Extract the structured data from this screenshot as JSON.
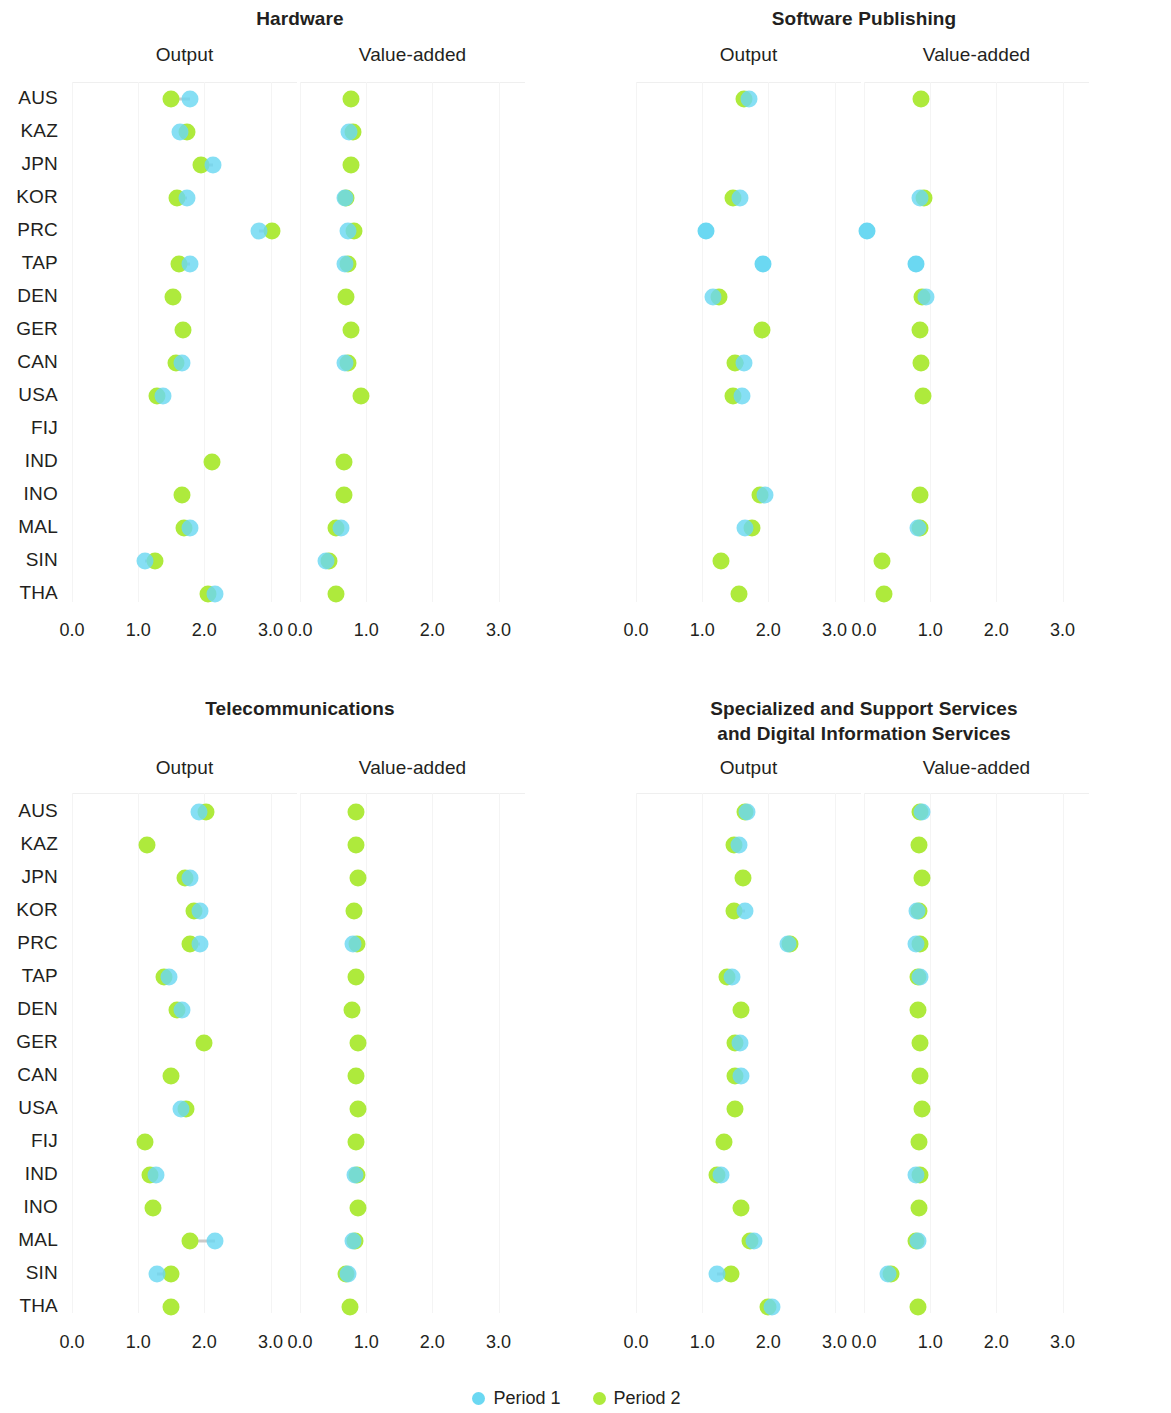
{
  "legend": {
    "items": [
      {
        "label": "Period 1",
        "color": "#6bd8f2",
        "key": "p1"
      },
      {
        "label": "Period 2",
        "color": "#aeea3c",
        "key": "p2"
      }
    ]
  },
  "economies": [
    "AUS",
    "KAZ",
    "JPN",
    "KOR",
    "PRC",
    "TAP",
    "DEN",
    "GER",
    "CAN",
    "USA",
    "FIJ",
    "IND",
    "INO",
    "MAL",
    "SIN",
    "THA"
  ],
  "subpanel_labels": {
    "output": "Output",
    "value_added": "Value-added"
  },
  "axis": {
    "ticks": [
      "0.0",
      "1.0",
      "2.0",
      "3.0"
    ],
    "tick_values": [
      0.0,
      1.0,
      2.0,
      3.0
    ],
    "min": 0.0,
    "max": 3.4
  },
  "panels": [
    {
      "title": "Hardware"
    },
    {
      "title": "Software Publishing"
    },
    {
      "title": "Telecommunications"
    },
    {
      "title": "Specialized and Support Services\nand Digital Information Services"
    }
  ],
  "chart_data": {
    "type": "scatter",
    "title": "",
    "subtitle": "",
    "xlabel": "",
    "ylabel": "",
    "xlim": [
      0.0,
      3.4
    ],
    "grid": true,
    "legend_position": "bottom",
    "series": [
      {
        "name": "Period 1",
        "color": "#6bd8f2"
      },
      {
        "name": "Period 2",
        "color": "#aeea3c"
      }
    ],
    "categories": [
      "AUS",
      "KAZ",
      "JPN",
      "KOR",
      "PRC",
      "TAP",
      "DEN",
      "GER",
      "CAN",
      "USA",
      "FIJ",
      "IND",
      "INO",
      "MAL",
      "SIN",
      "THA"
    ],
    "panels": [
      {
        "title": "Hardware",
        "subpanels": [
          {
            "label": "Output",
            "points": [
              {
                "category": "AUS",
                "period1": 1.79,
                "period2": 1.5
              },
              {
                "category": "KAZ",
                "period1": 1.63,
                "period2": 1.74
              },
              {
                "category": "JPN",
                "period1": 2.13,
                "period2": 1.95
              },
              {
                "category": "KOR",
                "period1": 1.74,
                "period2": 1.58
              },
              {
                "category": "PRC",
                "period1": 2.82,
                "period2": 3.02
              },
              {
                "category": "TAP",
                "period1": 1.78,
                "period2": 1.62
              },
              {
                "category": "DEN",
                "period1": null,
                "period2": 1.53
              },
              {
                "category": "GER",
                "period1": null,
                "period2": 1.68
              },
              {
                "category": "CAN",
                "period1": 1.66,
                "period2": 1.57
              },
              {
                "category": "USA",
                "period1": 1.38,
                "period2": 1.28
              },
              {
                "category": "FIJ",
                "period1": null,
                "period2": null
              },
              {
                "category": "IND",
                "period1": null,
                "period2": 2.11
              },
              {
                "category": "INO",
                "period1": null,
                "period2": 1.66
              },
              {
                "category": "MAL",
                "period1": 1.78,
                "period2": 1.69
              },
              {
                "category": "SIN",
                "period1": 1.1,
                "period2": 1.25
              },
              {
                "category": "THA",
                "period1": 2.16,
                "period2": 2.06
              }
            ]
          },
          {
            "label": "Value-added",
            "points": [
              {
                "category": "AUS",
                "period1": null,
                "period2": 0.77
              },
              {
                "category": "KAZ",
                "period1": 0.74,
                "period2": 0.8
              },
              {
                "category": "JPN",
                "period1": null,
                "period2": 0.77
              },
              {
                "category": "KOR",
                "period1": 0.68,
                "period2": 0.7
              },
              {
                "category": "PRC",
                "period1": 0.72,
                "period2": 0.81
              },
              {
                "category": "TAP",
                "period1": 0.68,
                "period2": 0.72
              },
              {
                "category": "DEN",
                "period1": null,
                "period2": 0.7
              },
              {
                "category": "GER",
                "period1": null,
                "period2": 0.77
              },
              {
                "category": "CAN",
                "period1": 0.68,
                "period2": 0.72
              },
              {
                "category": "USA",
                "period1": null,
                "period2": 0.92
              },
              {
                "category": "FIJ",
                "period1": null,
                "period2": null
              },
              {
                "category": "IND",
                "period1": null,
                "period2": 0.66
              },
              {
                "category": "INO",
                "period1": null,
                "period2": 0.66
              },
              {
                "category": "MAL",
                "period1": 0.62,
                "period2": 0.54
              },
              {
                "category": "SIN",
                "period1": 0.4,
                "period2": 0.44
              },
              {
                "category": "THA",
                "period1": null,
                "period2": 0.54
              }
            ]
          }
        ]
      },
      {
        "title": "Software Publishing",
        "subpanels": [
          {
            "label": "Output",
            "points": [
              {
                "category": "AUS",
                "period1": 1.7,
                "period2": 1.63
              },
              {
                "category": "KAZ",
                "period1": null,
                "period2": null
              },
              {
                "category": "JPN",
                "period1": null,
                "period2": null
              },
              {
                "category": "KOR",
                "period1": 1.57,
                "period2": 1.46
              },
              {
                "category": "PRC",
                "period1": 1.06,
                "period2": null
              },
              {
                "category": "TAP",
                "period1": 1.92,
                "period2": null
              },
              {
                "category": "DEN",
                "period1": 1.17,
                "period2": 1.25
              },
              {
                "category": "GER",
                "period1": null,
                "period2": 1.9
              },
              {
                "category": "CAN",
                "period1": 1.63,
                "period2": 1.49
              },
              {
                "category": "USA",
                "period1": 1.6,
                "period2": 1.47
              },
              {
                "category": "FIJ",
                "period1": null,
                "period2": null
              },
              {
                "category": "IND",
                "period1": null,
                "period2": null
              },
              {
                "category": "INO",
                "period1": 1.95,
                "period2": 1.87
              },
              {
                "category": "MAL",
                "period1": 1.65,
                "period2": 1.76
              },
              {
                "category": "SIN",
                "period1": null,
                "period2": 1.29
              },
              {
                "category": "THA",
                "period1": null,
                "period2": 1.55
              }
            ]
          },
          {
            "label": "Value-added",
            "points": [
              {
                "category": "AUS",
                "period1": null,
                "period2": 0.86
              },
              {
                "category": "KAZ",
                "period1": null,
                "period2": null
              },
              {
                "category": "JPN",
                "period1": null,
                "period2": null
              },
              {
                "category": "KOR",
                "period1": 0.84,
                "period2": 0.91
              },
              {
                "category": "PRC",
                "period1": 0.05,
                "period2": null
              },
              {
                "category": "TAP",
                "period1": 0.79,
                "period2": null
              },
              {
                "category": "DEN",
                "period1": 0.93,
                "period2": 0.88
              },
              {
                "category": "GER",
                "period1": null,
                "period2": 0.84
              },
              {
                "category": "CAN",
                "period1": null,
                "period2": 0.86
              },
              {
                "category": "USA",
                "period1": null,
                "period2": 0.89
              },
              {
                "category": "FIJ",
                "period1": null,
                "period2": null
              },
              {
                "category": "IND",
                "period1": null,
                "period2": null
              },
              {
                "category": "INO",
                "period1": null,
                "period2": 0.85
              },
              {
                "category": "MAL",
                "period1": 0.82,
                "period2": 0.85
              },
              {
                "category": "SIN",
                "period1": null,
                "period2": 0.27
              },
              {
                "category": "THA",
                "period1": null,
                "period2": 0.3
              }
            ]
          }
        ]
      },
      {
        "title": "Telecommunications",
        "subpanels": [
          {
            "label": "Output",
            "points": [
              {
                "category": "AUS",
                "period1": 1.92,
                "period2": 2.03
              },
              {
                "category": "KAZ",
                "period1": null,
                "period2": 1.13
              },
              {
                "category": "JPN",
                "period1": 1.78,
                "period2": 1.71
              },
              {
                "category": "KOR",
                "period1": 1.93,
                "period2": 1.84
              },
              {
                "category": "PRC",
                "period1": 1.93,
                "period2": 1.79
              },
              {
                "category": "TAP",
                "period1": 1.46,
                "period2": 1.39
              },
              {
                "category": "DEN",
                "period1": 1.66,
                "period2": 1.59
              },
              {
                "category": "GER",
                "period1": null,
                "period2": 2.0
              },
              {
                "category": "CAN",
                "period1": null,
                "period2": 1.49
              },
              {
                "category": "USA",
                "period1": 1.64,
                "period2": 1.72
              },
              {
                "category": "FIJ",
                "period1": null,
                "period2": 1.11
              },
              {
                "category": "IND",
                "period1": 1.27,
                "period2": 1.18
              },
              {
                "category": "INO",
                "period1": null,
                "period2": 1.22
              },
              {
                "category": "MAL",
                "period1": 2.16,
                "period2": 1.78
              },
              {
                "category": "SIN",
                "period1": 1.28,
                "period2": 1.49
              },
              {
                "category": "THA",
                "period1": null,
                "period2": 1.5
              }
            ]
          },
          {
            "label": "Value-added",
            "points": [
              {
                "category": "AUS",
                "period1": null,
                "period2": 0.85
              },
              {
                "category": "KAZ",
                "period1": null,
                "period2": 0.85
              },
              {
                "category": "JPN",
                "period1": null,
                "period2": 0.88
              },
              {
                "category": "KOR",
                "period1": null,
                "period2": 0.82
              },
              {
                "category": "PRC",
                "period1": 0.8,
                "period2": 0.86
              },
              {
                "category": "TAP",
                "period1": null,
                "period2": 0.85
              },
              {
                "category": "DEN",
                "period1": null,
                "period2": 0.78
              },
              {
                "category": "GER",
                "period1": null,
                "period2": 0.87
              },
              {
                "category": "CAN",
                "period1": null,
                "period2": 0.85
              },
              {
                "category": "USA",
                "period1": null,
                "period2": 0.88
              },
              {
                "category": "FIJ",
                "period1": null,
                "period2": 0.85
              },
              {
                "category": "IND",
                "period1": 0.83,
                "period2": 0.86
              },
              {
                "category": "INO",
                "period1": null,
                "period2": 0.88
              },
              {
                "category": "MAL",
                "period1": 0.8,
                "period2": 0.83
              },
              {
                "category": "SIN",
                "period1": 0.73,
                "period2": 0.7
              },
              {
                "category": "THA",
                "period1": null,
                "period2": 0.76
              }
            ]
          }
        ]
      },
      {
        "title": "Specialized and Support Services\nand Digital Information Services",
        "subpanels": [
          {
            "label": "Output",
            "points": [
              {
                "category": "AUS",
                "period1": 1.68,
                "period2": 1.64
              },
              {
                "category": "KAZ",
                "period1": 1.56,
                "period2": 1.48
              },
              {
                "category": "JPN",
                "period1": null,
                "period2": 1.62
              },
              {
                "category": "KOR",
                "period1": 1.65,
                "period2": 1.48
              },
              {
                "category": "PRC",
                "period1": 2.3,
                "period2": 2.33
              },
              {
                "category": "TAP",
                "period1": 1.45,
                "period2": 1.37
              },
              {
                "category": "DEN",
                "period1": null,
                "period2": 1.58
              },
              {
                "category": "GER",
                "period1": 1.57,
                "period2": 1.5
              },
              {
                "category": "CAN",
                "period1": 1.59,
                "period2": 1.5
              },
              {
                "category": "USA",
                "period1": null,
                "period2": 1.49
              },
              {
                "category": "FIJ",
                "period1": null,
                "period2": 1.33
              },
              {
                "category": "IND",
                "period1": 1.28,
                "period2": 1.23
              },
              {
                "category": "INO",
                "period1": null,
                "period2": 1.58
              },
              {
                "category": "MAL",
                "period1": 1.79,
                "period2": 1.73
              },
              {
                "category": "SIN",
                "period1": 1.22,
                "period2": 1.44
              },
              {
                "category": "THA",
                "period1": 2.05,
                "period2": 2.0
              }
            ]
          },
          {
            "label": "Value-added",
            "points": [
              {
                "category": "AUS",
                "period1": 0.87,
                "period2": 0.84
              },
              {
                "category": "KAZ",
                "period1": null,
                "period2": 0.83
              },
              {
                "category": "JPN",
                "period1": null,
                "period2": 0.87
              },
              {
                "category": "KOR",
                "period1": 0.8,
                "period2": 0.83
              },
              {
                "category": "PRC",
                "period1": 0.79,
                "period2": 0.84
              },
              {
                "category": "TAP",
                "period1": 0.84,
                "period2": 0.81
              },
              {
                "category": "DEN",
                "period1": null,
                "period2": 0.81
              },
              {
                "category": "GER",
                "period1": null,
                "period2": 0.85
              },
              {
                "category": "CAN",
                "period1": null,
                "period2": 0.85
              },
              {
                "category": "USA",
                "period1": null,
                "period2": 0.87
              },
              {
                "category": "FIJ",
                "period1": null,
                "period2": 0.83
              },
              {
                "category": "IND",
                "period1": 0.79,
                "period2": 0.84
              },
              {
                "category": "INO",
                "period1": null,
                "period2": 0.83
              },
              {
                "category": "MAL",
                "period1": 0.82,
                "period2": 0.79
              },
              {
                "category": "SIN",
                "period1": 0.36,
                "period2": 0.41
              },
              {
                "category": "THA",
                "period1": null,
                "period2": 0.81
              }
            ]
          }
        ]
      }
    ]
  }
}
